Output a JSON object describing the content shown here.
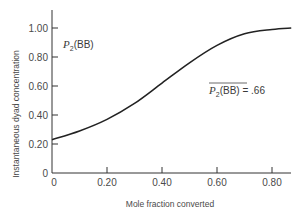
{
  "chart_data": {
    "type": "line",
    "title": "",
    "xlabel": "Mole fraction converted",
    "ylabel": "Instantaneous dyad concentration",
    "xlim": [
      0,
      0.87
    ],
    "ylim": [
      0,
      1.0
    ],
    "grid": false,
    "legend": null,
    "x_ticks": [
      "0",
      "0.20",
      "0.40",
      "0.60",
      "0.80"
    ],
    "y_ticks": [
      "0",
      "0.20",
      "0.40",
      "0.60",
      "0.80",
      "1.00"
    ],
    "series": [
      {
        "name": "P2(BB)",
        "x": [
          0.0,
          0.1,
          0.2,
          0.3,
          0.4,
          0.5,
          0.6,
          0.7,
          0.8,
          0.87
        ],
        "values": [
          0.23,
          0.29,
          0.37,
          0.48,
          0.62,
          0.76,
          0.88,
          0.96,
          0.99,
          1.0
        ]
      }
    ],
    "annotations": [
      {
        "text": "P2(BB)",
        "x": 0.04,
        "y": 0.88
      },
      {
        "text": "P2(BB) = .66",
        "overline": "P2(BB)",
        "x": 0.57,
        "y": 0.74
      }
    ]
  },
  "labels": {
    "curve_label_main": "P",
    "curve_label_sub": "2",
    "curve_label_rest": "(BB)",
    "avg_label_main": "P",
    "avg_label_sub": "2",
    "avg_label_rest": "(BB)",
    "avg_label_value": " = .66"
  }
}
